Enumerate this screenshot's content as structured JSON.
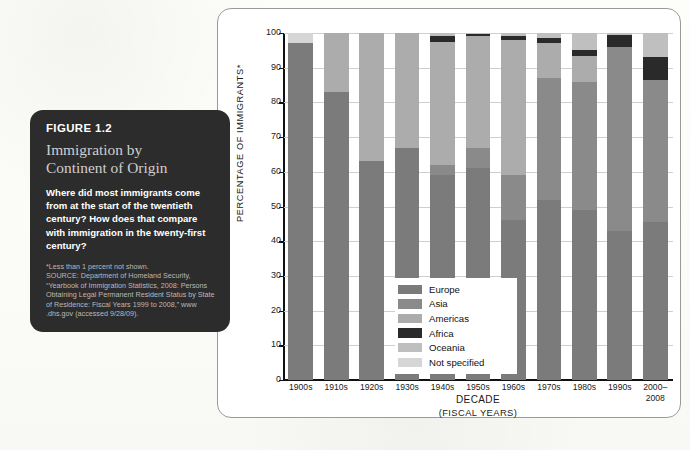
{
  "figure": {
    "number": "FIGURE 1.2",
    "title_line1": "Immigration by",
    "title_line2": "Continent of Origin",
    "description": "Where did most immigrants come from at the start of the twentieth century? How does that compare with immigration in the twenty-first century?",
    "source_lines": [
      "*Less than 1 percent not shown.",
      "SOURCE: Department of Homeland Security,",
      "“Yearbook of Immigration Statistics, 2008: Persons",
      "Obtaining Legal Permanent Resident Status by State",
      "of Residence: Fiscal Years 1999 to 2008,” www",
      ".dhs.gov (accessed 9/28/09)."
    ]
  },
  "chart_data": {
    "type": "bar",
    "subtype": "stacked-vertical-100pct",
    "title": "Immigration by Continent of Origin",
    "xlabel": "DECADE",
    "xlabel_sub": "(FISCAL YEARS)",
    "ylabel": "PERCENTAGE OF IMMIGRANTS*",
    "ylim": [
      0,
      100
    ],
    "yticks": [
      0,
      10,
      20,
      30,
      40,
      50,
      60,
      70,
      80,
      90,
      100
    ],
    "ytick_labels": [
      "0",
      "10",
      "20",
      "30",
      "40",
      "50",
      "60",
      "70",
      "80",
      "90",
      "100"
    ],
    "grid": true,
    "legend_position": "inside-lower-left",
    "categories": [
      "1900s",
      "1910s",
      "1920s",
      "1930s",
      "1940s",
      "1950s",
      "1960s",
      "1970s",
      "1980s",
      "1990s",
      "2000–\n2008"
    ],
    "category_labels": [
      [
        "1900s"
      ],
      [
        "1910s"
      ],
      [
        "1920s"
      ],
      [
        "1930s"
      ],
      [
        "1940s"
      ],
      [
        "1950s"
      ],
      [
        "1960s"
      ],
      [
        "1970s"
      ],
      [
        "1980s"
      ],
      [
        "1990s"
      ],
      [
        "2000–",
        "2008"
      ]
    ],
    "series": [
      {
        "name": "Europe",
        "color": "#7b7b7b",
        "values": [
          97.0,
          83.0,
          63.0,
          67.0,
          59.0,
          61.0,
          46.0,
          52.0,
          49.0,
          43.0,
          45.5
        ]
      },
      {
        "name": "Asia",
        "color": "#8a8a8a",
        "values": [
          0.0,
          0.0,
          0.0,
          0.0,
          3.0,
          6.0,
          13.0,
          35.0,
          37.0,
          53.0,
          41.0
        ]
      },
      {
        "name": "Americas",
        "color": "#acacac",
        "values": [
          0.0,
          17.0,
          37.0,
          33.0,
          35.5,
          32.0,
          39.0,
          10.0,
          7.5,
          0.0,
          0.0
        ]
      },
      {
        "name": "Africa",
        "color": "#2a2a2a",
        "values": [
          0.0,
          0.0,
          0.0,
          0.0,
          1.5,
          0.7,
          1.0,
          1.5,
          1.5,
          3.5,
          6.5
        ]
      },
      {
        "name": "Oceania",
        "color": "#bfbfbf",
        "values": [
          0.0,
          0.0,
          0.0,
          0.0,
          1.0,
          0.3,
          1.0,
          1.5,
          5.0,
          0.5,
          7.0
        ]
      },
      {
        "name": "Not specified",
        "color": "#d6d6d6",
        "values": [
          3.0,
          0.0,
          0.0,
          0.0,
          0.0,
          0.0,
          0.0,
          0.0,
          0.0,
          0.0,
          0.0
        ]
      }
    ],
    "legend": [
      {
        "label": "Europe",
        "color": "#7b7b7b"
      },
      {
        "label": "Asia",
        "color": "#8a8a8a"
      },
      {
        "label": "Americas",
        "color": "#acacac"
      },
      {
        "label": "Africa",
        "color": "#2a2a2a"
      },
      {
        "label": "Oceania",
        "color": "#bfbfbf"
      },
      {
        "label": "Not specified",
        "color": "#d6d6d6"
      }
    ]
  }
}
